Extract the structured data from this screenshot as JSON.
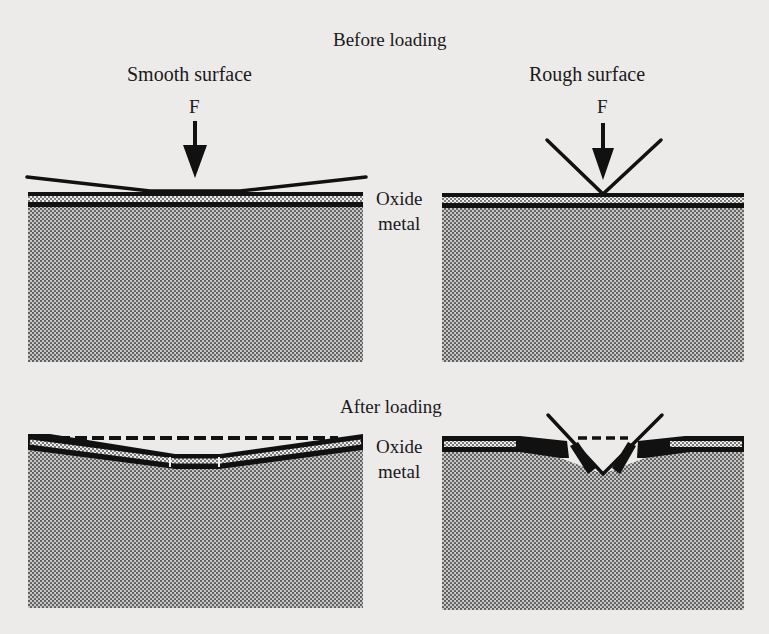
{
  "figure": {
    "before": {
      "title": "Before loading",
      "smooth_label": "Smooth surface",
      "rough_label": "Rough surface",
      "force_left": "F",
      "force_right": "F",
      "oxide_label": "Oxide",
      "metal_label": "metal"
    },
    "after": {
      "title": "After loading",
      "oxide_label": "Oxide",
      "metal_label": "metal"
    },
    "colors": {
      "background": "#ecebea",
      "ink": "#111111",
      "metal_fill": "#9a9a9a",
      "oxide_fill": "#d8d8d8"
    }
  }
}
